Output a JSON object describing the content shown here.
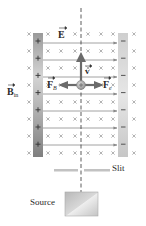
{
  "figure": {
    "labels": {
      "electric_field": "E",
      "velocity": "v",
      "magnetic_force": "F",
      "magnetic_force_sub": "B",
      "electric_force": "F",
      "electric_force_sub": "e",
      "magnetic_field": "B",
      "magnetic_field_sub": "in",
      "slit": "Slit",
      "source": "Source"
    },
    "plates": {
      "left": {
        "charge_symbol": "+",
        "count": 7
      },
      "right": {
        "charge_symbol": "−",
        "count": 7
      }
    },
    "field_symbols": {
      "magnetic_field_into_page": "×"
    },
    "particle": {
      "charge_symbol": "+"
    },
    "colors": {
      "field_line": "#8a8a8a",
      "cross": "#9a9a9a",
      "arrow": "#6b6b6b",
      "plate_left_dark": "#8d8d8d",
      "plate_left_light": "#cfcfcf",
      "plate_right": "#d9d9d9",
      "text": "#2b2b2b"
    }
  }
}
